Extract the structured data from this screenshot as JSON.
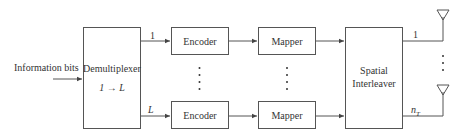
{
  "diagram": {
    "input_label": "Information bits",
    "demux": {
      "title": "Demultiplexer",
      "subtitle": "1 → L"
    },
    "branch_labels": {
      "top": "1",
      "bottom": "L"
    },
    "encoder_label": "Encoder",
    "mapper_label": "Mapper",
    "interleaver": {
      "line1": "Spatial",
      "line2": "Interleaver"
    },
    "output_labels": {
      "top": "1",
      "bottom": "n",
      "bottom_sub": "T"
    },
    "icons": {
      "antenna": "antenna-icon",
      "ellipsis": "vertical-dots-icon"
    },
    "colors": {
      "stroke": "#555555",
      "text": "#333333",
      "background": "#ffffff"
    }
  }
}
